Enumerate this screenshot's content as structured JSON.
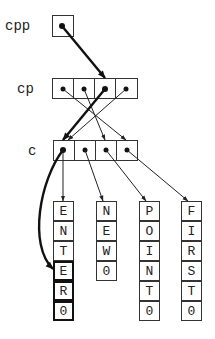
{
  "diagram": {
    "labels": {
      "cpp": "cpp",
      "cp": "cp",
      "c": "c"
    },
    "strings": [
      {
        "name": "ENTER",
        "chars": [
          "E",
          "N",
          "T",
          "E",
          "R",
          "0"
        ]
      },
      {
        "name": "NEW",
        "chars": [
          "N",
          "E",
          "W",
          "0"
        ]
      },
      {
        "name": "POINT",
        "chars": [
          "P",
          "O",
          "I",
          "N",
          "T",
          "0"
        ]
      },
      {
        "name": "FIRST",
        "chars": [
          "F",
          "I",
          "R",
          "S",
          "T",
          "0"
        ]
      }
    ],
    "pointers": {
      "cpp": "cp[2]",
      "cp": [
        "c[3]",
        "c[2]",
        "c[0]",
        "c[0]"
      ],
      "c": [
        "ENTER",
        "NEW",
        "POINT",
        "FIRST"
      ]
    },
    "highlighted": {
      "cpp_arrow": "thick",
      "cp_2_arrow": "thick",
      "curve": "c[0] -> ENTER[3] (*++*cpp... )",
      "highlighted_cells": "ENTER[3..5]"
    },
    "colors": {
      "line": "#222222",
      "box": "#333333",
      "background": "#ffffff"
    }
  }
}
